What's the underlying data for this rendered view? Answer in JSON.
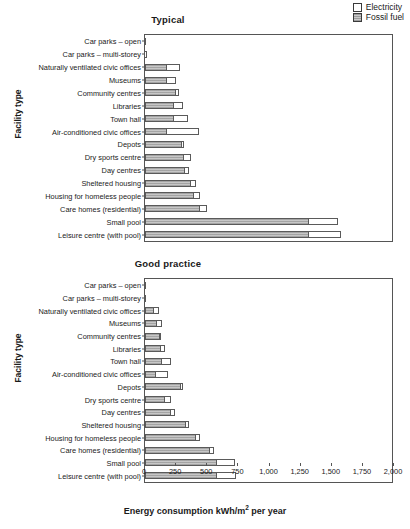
{
  "legend": {
    "position": "top-right",
    "items": [
      {
        "label": "Electricity",
        "swatch": "white",
        "color": "#ffffff"
      },
      {
        "label": "Fossil fuel",
        "swatch": "hatched-grey",
        "color": "#c7c7c7"
      }
    ]
  },
  "axes": {
    "ylabel": "Facility type",
    "xlabel_text": "Energy consumption kWh/m",
    "xlabel_sup": "2",
    "xlabel_tail": " per year",
    "xlabel_full": "Energy consumption kWh/m2 per year",
    "xlim": [
      0,
      2000
    ],
    "xticks": [
      0,
      250,
      500,
      750,
      1000,
      1250,
      1500,
      1750,
      2000
    ],
    "xticklabels": [
      "0",
      "250",
      "500",
      "750",
      "1,000",
      "1,250",
      "1,500",
      "1,750",
      "2,000"
    ],
    "grid": false
  },
  "categories": [
    "Car parks – open",
    "Car parks – multi-storey",
    "Naturally ventilated civic offices",
    "Museums",
    "Community centres",
    "Libraries",
    "Town hall",
    "Air-conditioned civic offices",
    "Depots",
    "Dry sports centre",
    "Day centres",
    "Sheltered housing",
    "Housing for homeless people",
    "Care homes (residential)",
    "Small pool",
    "Leisure centre (with pool)"
  ],
  "panels": [
    {
      "id": "typical",
      "title": "Typical"
    },
    {
      "id": "good",
      "title": "Good practice"
    }
  ],
  "chart_data": [
    {
      "type": "bar",
      "orientation": "horizontal",
      "stacked": true,
      "title": "Typical",
      "xlabel": "Energy consumption kWh/m2 per year",
      "ylabel": "Facility type",
      "xlim": [
        0,
        2000
      ],
      "xticks": [
        0,
        250,
        500,
        750,
        1000,
        1250,
        1500,
        1750,
        2000
      ],
      "categories": [
        "Car parks – open",
        "Car parks – multi-storey",
        "Naturally ventilated civic offices",
        "Museums",
        "Community centres",
        "Libraries",
        "Town hall",
        "Air-conditioned civic offices",
        "Depots",
        "Dry sports centre",
        "Day centres",
        "Sheltered housing",
        "Housing for homeless people",
        "Care homes (residential)",
        "Small pool",
        "Leisure centre (with pool)"
      ],
      "series": [
        {
          "name": "Fossil fuel",
          "values": [
            0,
            0,
            180,
            180,
            250,
            230,
            230,
            180,
            300,
            310,
            320,
            370,
            390,
            440,
            1320,
            1320
          ]
        },
        {
          "name": "Electricity",
          "values": [
            5,
            25,
            110,
            80,
            30,
            80,
            120,
            260,
            20,
            70,
            40,
            50,
            60,
            70,
            240,
            260
          ]
        }
      ],
      "totals": [
        5,
        25,
        290,
        260,
        280,
        310,
        350,
        440,
        320,
        380,
        360,
        420,
        450,
        510,
        1560,
        1580
      ]
    },
    {
      "type": "bar",
      "orientation": "horizontal",
      "stacked": true,
      "title": "Good practice",
      "xlabel": "Energy consumption kWh/m2 per year",
      "ylabel": "Facility type",
      "xlim": [
        0,
        2000
      ],
      "xticks": [
        0,
        250,
        500,
        750,
        1000,
        1250,
        1500,
        1750,
        2000
      ],
      "categories": [
        "Car parks – open",
        "Car parks – multi-storey",
        "Naturally ventilated civic offices",
        "Museums",
        "Community centres",
        "Libraries",
        "Town hall",
        "Air-conditioned civic offices",
        "Depots",
        "Dry sports centre",
        "Day centres",
        "Sheltered housing",
        "Housing for homeless people",
        "Care homes (residential)",
        "Small pool",
        "Leisure centre (with pool)"
      ],
      "series": [
        {
          "name": "Fossil fuel",
          "values": [
            0,
            0,
            75,
            100,
            120,
            130,
            140,
            85,
            290,
            160,
            210,
            330,
            410,
            520,
            580,
            580
          ]
        },
        {
          "name": "Electricity",
          "values": [
            3,
            5,
            45,
            45,
            20,
            35,
            80,
            110,
            25,
            60,
            40,
            35,
            40,
            45,
            150,
            160
          ]
        }
      ],
      "totals": [
        3,
        5,
        120,
        145,
        140,
        165,
        220,
        195,
        315,
        220,
        250,
        365,
        450,
        565,
        730,
        740
      ]
    }
  ]
}
